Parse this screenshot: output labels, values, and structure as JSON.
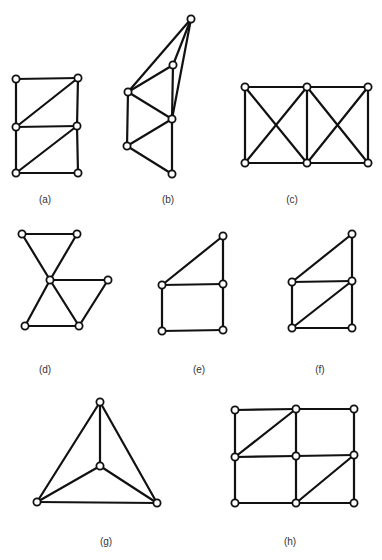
{
  "figure": {
    "panels": [
      {
        "id": "a",
        "label": "(a)",
        "nodes": [
          [
            16,
            79
          ],
          [
            78,
            78
          ],
          [
            16,
            127
          ],
          [
            77,
            126
          ],
          [
            16,
            173
          ],
          [
            78,
            173
          ]
        ],
        "edges": [
          [
            0,
            1
          ],
          [
            0,
            2
          ],
          [
            1,
            3
          ],
          [
            2,
            1
          ],
          [
            2,
            3
          ],
          [
            2,
            4
          ],
          [
            3,
            5
          ],
          [
            4,
            3
          ],
          [
            4,
            5
          ]
        ]
      },
      {
        "id": "b",
        "label": "(b)",
        "nodes": [
          [
            191,
            19
          ],
          [
            173,
            65
          ],
          [
            128,
            92
          ],
          [
            172,
            119
          ],
          [
            127,
            146
          ],
          [
            172,
            174
          ]
        ],
        "edges": [
          [
            2,
            0
          ],
          [
            1,
            0
          ],
          [
            3,
            0
          ],
          [
            2,
            1
          ],
          [
            1,
            3
          ],
          [
            2,
            3
          ],
          [
            2,
            4
          ],
          [
            4,
            3
          ],
          [
            4,
            5
          ],
          [
            3,
            5
          ]
        ]
      },
      {
        "id": "c",
        "label": "(c)",
        "nodes": [
          [
            245,
            87
          ],
          [
            307,
            87
          ],
          [
            368,
            87
          ],
          [
            245,
            163
          ],
          [
            307,
            163
          ],
          [
            368,
            163
          ]
        ],
        "edges": [
          [
            0,
            1
          ],
          [
            1,
            2
          ],
          [
            3,
            4
          ],
          [
            4,
            5
          ],
          [
            0,
            3
          ],
          [
            1,
            4
          ],
          [
            2,
            5
          ],
          [
            0,
            4
          ],
          [
            1,
            3
          ],
          [
            1,
            5
          ],
          [
            2,
            4
          ]
        ]
      },
      {
        "id": "d",
        "label": "(d)",
        "nodes": [
          [
            22,
            234
          ],
          [
            77,
            234
          ],
          [
            50,
            280
          ],
          [
            108,
            280
          ],
          [
            25,
            326
          ],
          [
            79,
            326
          ]
        ],
        "edges": [
          [
            0,
            1
          ],
          [
            0,
            2
          ],
          [
            1,
            2
          ],
          [
            2,
            3
          ],
          [
            2,
            4
          ],
          [
            2,
            5
          ],
          [
            4,
            5
          ],
          [
            3,
            5
          ]
        ]
      },
      {
        "id": "e",
        "label": "(e)",
        "nodes": [
          [
            162,
            285
          ],
          [
            223,
            236
          ],
          [
            223,
            284
          ],
          [
            162,
            331
          ],
          [
            223,
            330
          ]
        ],
        "edges": [
          [
            0,
            1
          ],
          [
            1,
            2
          ],
          [
            0,
            2
          ],
          [
            0,
            3
          ],
          [
            2,
            4
          ],
          [
            3,
            4
          ]
        ]
      },
      {
        "id": "f",
        "label": "(f)",
        "nodes": [
          [
            292,
            282
          ],
          [
            352,
            234
          ],
          [
            352,
            281
          ],
          [
            292,
            328
          ],
          [
            352,
            328
          ]
        ],
        "edges": [
          [
            0,
            1
          ],
          [
            1,
            2
          ],
          [
            0,
            2
          ],
          [
            0,
            3
          ],
          [
            2,
            4
          ],
          [
            3,
            4
          ],
          [
            3,
            2
          ]
        ]
      },
      {
        "id": "g",
        "label": "(g)",
        "nodes": [
          [
            100,
            402
          ],
          [
            100,
            466
          ],
          [
            37,
            502
          ],
          [
            157,
            503
          ]
        ],
        "edges": [
          [
            0,
            2
          ],
          [
            0,
            3
          ],
          [
            2,
            3
          ],
          [
            0,
            1
          ],
          [
            1,
            2
          ],
          [
            1,
            3
          ]
        ]
      },
      {
        "id": "h",
        "label": "(h)",
        "nodes": [
          [
            235,
            410
          ],
          [
            296,
            409
          ],
          [
            354,
            409
          ],
          [
            235,
            457
          ],
          [
            296,
            456
          ],
          [
            354,
            455
          ],
          [
            235,
            503
          ],
          [
            296,
            503
          ],
          [
            354,
            503
          ]
        ],
        "edges": [
          [
            0,
            1
          ],
          [
            1,
            2
          ],
          [
            3,
            4
          ],
          [
            4,
            5
          ],
          [
            6,
            7
          ],
          [
            7,
            8
          ],
          [
            0,
            3
          ],
          [
            3,
            6
          ],
          [
            1,
            4
          ],
          [
            4,
            7
          ],
          [
            2,
            5
          ],
          [
            5,
            8
          ],
          [
            3,
            1
          ],
          [
            7,
            5
          ]
        ]
      }
    ]
  }
}
